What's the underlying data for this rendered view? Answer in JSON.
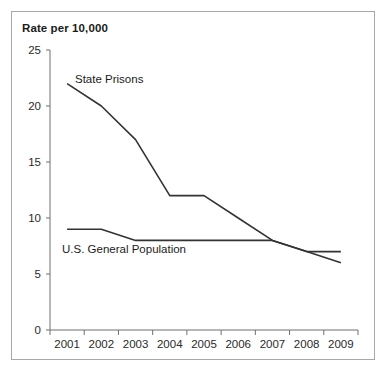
{
  "chart_data": {
    "type": "line",
    "title": "Rate per 10,000",
    "xlabel": "",
    "ylabel": "Rate per 10,000",
    "categories": [
      "2001",
      "2002",
      "2003",
      "2004",
      "2005",
      "2006",
      "2007",
      "2008",
      "2009"
    ],
    "x": [
      2001,
      2002,
      2003,
      2004,
      2005,
      2006,
      2007,
      2008,
      2009
    ],
    "series": [
      {
        "name": "State Prisons",
        "values": [
          22,
          20,
          17,
          12,
          12,
          10,
          8,
          7,
          6
        ],
        "color": "#333333",
        "label_x": 2002,
        "label_y": 23
      },
      {
        "name": "U.S. General Population",
        "values": [
          9,
          9,
          8,
          8,
          8,
          8,
          8,
          7,
          7
        ],
        "color": "#333333",
        "label_x": 2003,
        "label_y": 6.6
      }
    ],
    "ylim": [
      0,
      25
    ],
    "yticks": [
      0,
      5,
      10,
      15,
      20,
      25
    ],
    "ytick_labels": [
      "0",
      "5",
      "10",
      "15",
      "20",
      "25"
    ],
    "xtick_labels": [
      "2001",
      "2002",
      "2003",
      "2004",
      "2005",
      "2006",
      "2007",
      "2008",
      "2009"
    ],
    "grid": false,
    "legend": "inline-labels",
    "legend_position": "inline",
    "frame_color": "#a8a8a8",
    "axis_color": "#6f6f6f",
    "background": "#ffffff"
  },
  "figure": {
    "title": "Rate per 10,000",
    "series_one_label": "State Prisons",
    "series_two_label": "U.S. General Population"
  },
  "axis": {
    "y_labels": [
      "25",
      "20",
      "15",
      "10",
      "5",
      "0"
    ],
    "x_labels": [
      "2001",
      "2002",
      "2003",
      "2004",
      "2005",
      "2006",
      "2007",
      "2008",
      "2009"
    ]
  }
}
